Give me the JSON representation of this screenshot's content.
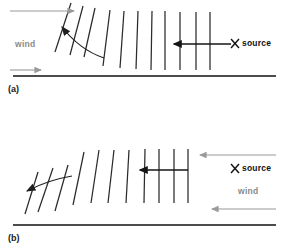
{
  "figure": {
    "width": 289,
    "height": 250,
    "background": "#ffffff",
    "type": "scientific-diagram"
  },
  "colors": {
    "front_line": "#2b2b2b",
    "baseline": "#111111",
    "wind_arrow": "#9a9a9a",
    "wind_text": "#8a8a8a",
    "source_text": "#111111",
    "propagation_arrow": "#151515",
    "panel_label": "#1a1a1a"
  },
  "panels": [
    {
      "id": "a",
      "label": "(a)",
      "label_x": 8,
      "label_y": 92,
      "wind_label": "wind",
      "wind_label_x": 15,
      "wind_label_y": 47,
      "source_label": "source",
      "source_label_x": 243,
      "source_label_y": 46,
      "source_marker": "X",
      "source_marker_x": 235,
      "source_marker_y": 43,
      "wind_direction": "left-to-right",
      "propagation_direction": "right-to-left",
      "baseline_y": 76,
      "baseline_x1": 13,
      "baseline_x2": 276,
      "wind_arrows": [
        {
          "x1": 10,
          "y1": 11,
          "x2": 78,
          "y2": 11,
          "dir": "right"
        },
        {
          "x1": 10,
          "y1": 70,
          "x2": 45,
          "y2": 70,
          "dir": "right"
        }
      ],
      "propagation_arrow": {
        "x1": 235,
        "y1": 44,
        "x2": 172,
        "y2": 44,
        "dir": "left"
      },
      "curve_arrow": {
        "dir": "left",
        "tip_x": 57,
        "tip_y": 25
      },
      "front_lines": [
        {
          "x_top": 71,
          "y_top": 3,
          "x_bot": 55,
          "y_bot": 52
        },
        {
          "x_top": 83,
          "y_top": 6,
          "x_bot": 70,
          "y_bot": 55
        },
        {
          "x_top": 95,
          "y_top": 8,
          "x_bot": 84,
          "y_bot": 57
        },
        {
          "x_top": 110,
          "y_top": 10,
          "x_bot": 103,
          "y_bot": 66
        },
        {
          "x_top": 124,
          "y_top": 11,
          "x_bot": 120,
          "y_bot": 68
        },
        {
          "x_top": 138,
          "y_top": 11,
          "x_bot": 136,
          "y_bot": 69
        },
        {
          "x_top": 152,
          "y_top": 11,
          "x_bot": 151,
          "y_bot": 70
        },
        {
          "x_top": 165,
          "y_top": 11,
          "x_bot": 165,
          "y_bot": 70
        },
        {
          "x_top": 180,
          "y_top": 12,
          "x_bot": 180,
          "y_bot": 70
        },
        {
          "x_top": 196,
          "y_top": 12,
          "x_bot": 196,
          "y_bot": 70
        },
        {
          "x_top": 210,
          "y_top": 12,
          "x_bot": 210,
          "y_bot": 70
        }
      ]
    },
    {
      "id": "b",
      "label": "(b)",
      "label_x": 8,
      "label_y": 241,
      "wind_label": "wind",
      "wind_label_x": 238,
      "wind_label_y": 194,
      "source_label": "source",
      "source_label_x": 243,
      "source_label_y": 171,
      "source_marker": "X",
      "source_marker_x": 235,
      "source_marker_y": 168,
      "wind_direction": "right-to-left",
      "propagation_direction": "right-to-left",
      "baseline_y": 225,
      "baseline_x1": 13,
      "baseline_x2": 276,
      "wind_arrows": [
        {
          "x1": 276,
          "y1": 155,
          "x2": 196,
          "y2": 155,
          "dir": "left"
        },
        {
          "x1": 276,
          "y1": 209,
          "x2": 208,
          "y2": 209,
          "dir": "left"
        }
      ],
      "propagation_arrow": {
        "x1": 188,
        "y1": 170,
        "x2": 138,
        "y2": 170,
        "dir": "left"
      },
      "curve_arrow": {
        "dir": "left-down",
        "tip_x": 22,
        "tip_y": 190
      },
      "front_lines": [
        {
          "x_top": 38,
          "y_top": 172,
          "x_bot": 25,
          "y_bot": 214
        },
        {
          "x_top": 53,
          "y_top": 168,
          "x_bot": 38,
          "y_bot": 212
        },
        {
          "x_top": 68,
          "y_top": 165,
          "x_bot": 55,
          "y_bot": 211
        },
        {
          "x_top": 84,
          "y_top": 152,
          "x_bot": 73,
          "y_bot": 205
        },
        {
          "x_top": 99,
          "y_top": 150,
          "x_bot": 91,
          "y_bot": 203
        },
        {
          "x_top": 114,
          "y_top": 150,
          "x_bot": 108,
          "y_bot": 203
        },
        {
          "x_top": 129,
          "y_top": 150,
          "x_bot": 126,
          "y_bot": 203
        },
        {
          "x_top": 145,
          "y_top": 149,
          "x_bot": 144,
          "y_bot": 203
        },
        {
          "x_top": 159,
          "y_top": 149,
          "x_bot": 159,
          "y_bot": 203
        },
        {
          "x_top": 174,
          "y_top": 149,
          "x_bot": 174,
          "y_bot": 203
        },
        {
          "x_top": 188,
          "y_top": 149,
          "x_bot": 188,
          "y_bot": 203
        }
      ]
    }
  ]
}
